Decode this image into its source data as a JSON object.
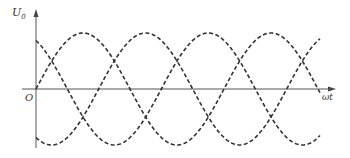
{
  "chart_data": {
    "type": "line",
    "title": "",
    "xlabel": "ωt",
    "ylabel": "U0",
    "origin_label": "O",
    "grid": false,
    "legend": null,
    "line_style": "dashed",
    "line_color": "#333333",
    "axis_color": "#555555",
    "ylim": [
      -1,
      1
    ],
    "x_range_periods": 1.55,
    "series": [
      {
        "name": "phase A",
        "phase_deg": 0,
        "amplitude": 1
      },
      {
        "name": "phase B",
        "phase_deg": 120,
        "amplitude": 1
      },
      {
        "name": "phase C",
        "phase_deg": 240,
        "amplitude": 1
      }
    ]
  },
  "labels": {
    "y_main": "U",
    "y_sub": "0",
    "origin": "O",
    "x": "ωt"
  }
}
